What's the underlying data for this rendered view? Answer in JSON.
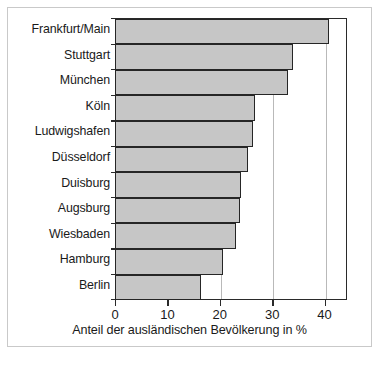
{
  "chart_data": {
    "type": "bar",
    "orientation": "horizontal",
    "title": "",
    "xlabel": "Anteil der ausländischen Bevölkerung in %",
    "ylabel": "",
    "categories": [
      "Frankfurt/Main",
      "Stuttgart",
      "München",
      "Köln",
      "Ludwigshafen",
      "Düsseldorf",
      "Duisburg",
      "Augsburg",
      "Wiesbaden",
      "Hamburg",
      "Berlin"
    ],
    "values": [
      40.9,
      34.0,
      33.0,
      26.7,
      26.3,
      25.4,
      24.0,
      23.8,
      23.1,
      20.6,
      16.4
    ],
    "xlim": [
      0,
      44.3
    ],
    "xticks": [
      0,
      10,
      20,
      30,
      40
    ],
    "xtick_labels": [
      "0",
      "10",
      "20",
      "30",
      "40"
    ],
    "gridlines_x": [
      10,
      20,
      30,
      40
    ],
    "grid": true,
    "legend": null,
    "bar_fill_color": "#c6c6c6",
    "bar_border_color": "#262626",
    "axis_color": "#2a2a2a",
    "grid_color": "#b9b9b9"
  },
  "figure": {
    "frame_color": "#c9c9c9",
    "background": "#ffffff",
    "bottom_fragment": ""
  }
}
